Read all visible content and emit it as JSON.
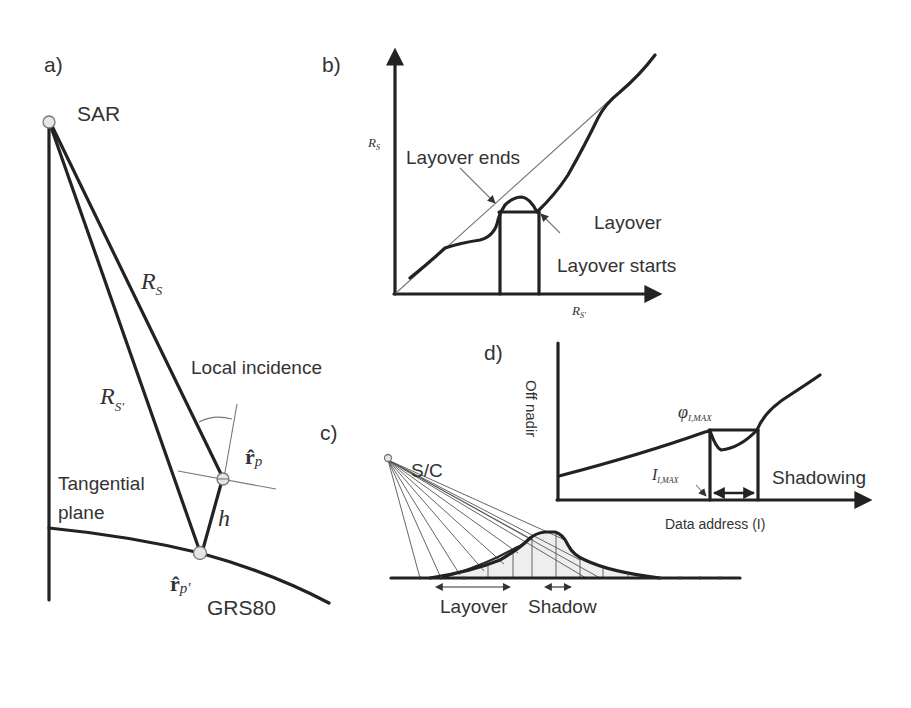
{
  "figure": {
    "panels": {
      "a": {
        "label": "a)",
        "sensor_label": "SAR",
        "range_label": "R",
        "range_sub": "S",
        "range2_label": "R",
        "range2_sub": "S'",
        "local_incidence_label": "Local incidence",
        "tangential_label_line1": "Tangential",
        "tangential_label_line2": "plane",
        "rp_label": "r̂",
        "rp_sub": "p",
        "rp2_label": "r̂",
        "rp2_sub": "p'",
        "height_label": "h",
        "ellipsoid_label": "GRS80"
      },
      "b": {
        "label": "b)",
        "y_axis_label": "R",
        "y_axis_sub": "S",
        "x_axis_label": "R",
        "x_axis_sub": "S'",
        "layover_ends": "Layover ends",
        "layover": "Layover",
        "layover_starts": "Layover starts"
      },
      "c": {
        "label": "c)",
        "sensor_label": "S/C",
        "layover_label": "Layover",
        "shadow_label": "Shadow"
      },
      "d": {
        "label": "d)",
        "y_axis_label": "Off nadir",
        "x_axis_label": "Data address (I)",
        "phi_label": "φ",
        "phi_sub": "I,MAX",
        "i_label": "I",
        "i_sub": "I,MAX",
        "shadowing_label": "Shadowing"
      }
    },
    "colors": {
      "line": "#222222",
      "text": "#333333",
      "thin_line": "#777777",
      "fill_terrain": "#eeeeee",
      "node_fill": "#e6e6e6"
    }
  }
}
